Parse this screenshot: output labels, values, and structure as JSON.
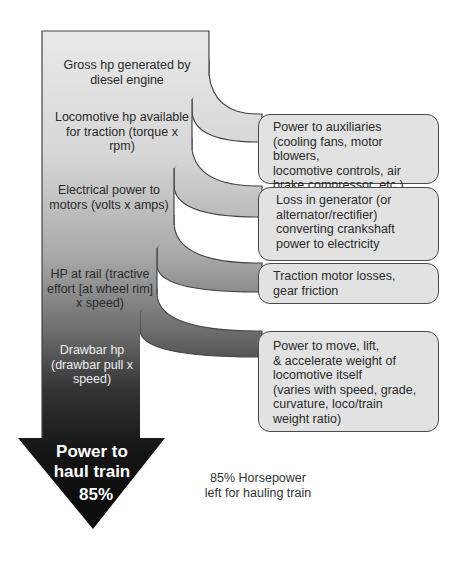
{
  "diagram": {
    "stages": [
      {
        "label": "Gross hp generated by diesel engine"
      },
      {
        "label": "Locomotive hp available for traction (torque x rpm)"
      },
      {
        "label": "Electrical power to motors (volts x amps)"
      },
      {
        "label": "HP at rail (tractive effort [at wheel rim] x speed)"
      },
      {
        "label": "Drawbar hp (drawbar pull x speed)"
      }
    ],
    "losses": [
      {
        "line1": "Power to auxiliaries",
        "line2": "(cooling fans, motor blowers,",
        "line3": "locomotive controls, air",
        "line4": "brake compressor, etc.)"
      },
      {
        "line1": "Loss in generator (or",
        "line2": "alternator/rectifier)",
        "line3": "converting crankshaft",
        "line4": "power to electricity"
      },
      {
        "line1": "Traction motor losses,",
        "line2": "gear friction"
      },
      {
        "line1": "Power to move, lift,",
        "line2": "& accelerate weight of",
        "line3": "locomotive itself",
        "line4": "(varies with speed, grade,",
        "line5": "curvature, loco/train",
        "line6": "weight ratio)"
      }
    ],
    "output": {
      "line1": "Power to",
      "line2": "haul train",
      "percent": "85%"
    },
    "caption": {
      "line1": "85% Horsepower",
      "line2": "left for hauling train"
    },
    "colors": {
      "top": "#e8e8e8",
      "bottom": "#101010",
      "box_fill": "#e2e2e2",
      "stroke": "#444444"
    }
  }
}
